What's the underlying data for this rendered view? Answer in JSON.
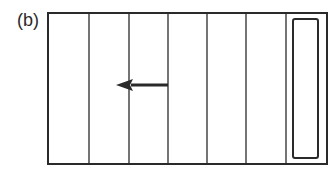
{
  "figure": {
    "panel_label": "(b)",
    "outer_box": {
      "x": 48,
      "y": 13,
      "width": 279,
      "height": 151
    },
    "strip_dividers_x": [
      89,
      129,
      168,
      207,
      246,
      286
    ],
    "inner_rect": {
      "x": 293,
      "y": 19,
      "width": 25,
      "height": 139,
      "rx": 2
    },
    "arrow": {
      "direction": "left",
      "from_x": 168,
      "to_x": 116,
      "y": 85
    },
    "colors": {
      "line": "#2a2a2a",
      "background": "#ffffff"
    }
  }
}
